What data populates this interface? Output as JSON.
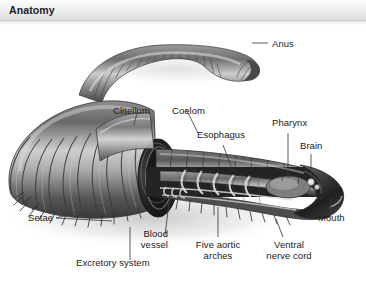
{
  "header": {
    "title": "Anatomy"
  },
  "figure": {
    "alt": "Cutaway illustration of an earthworm showing external segments and internal organs",
    "palette": {
      "body_dark": "#3d3d3d",
      "body_mid": "#6e6e6e",
      "body_light": "#b4b4b4",
      "highlight": "#e2e2e2",
      "organ_dark": "#2b2b2b",
      "background": "#ffffff",
      "label_text": "#1a1a1a",
      "leader_line": "#4d4d4d",
      "header_text": "#1c1c1c"
    }
  },
  "labels": [
    {
      "id": "anus",
      "text": "Anus"
    },
    {
      "id": "clitellum",
      "text": "Clitellum"
    },
    {
      "id": "coelom",
      "text": "Coelom"
    },
    {
      "id": "esophagus",
      "text": "Esophagus"
    },
    {
      "id": "pharynx",
      "text": "Pharynx"
    },
    {
      "id": "brain",
      "text": "Brain"
    },
    {
      "id": "mouth",
      "text": "Mouth"
    },
    {
      "id": "setae",
      "text": "Setae"
    },
    {
      "id": "blood_vessel_1",
      "text": "Blood"
    },
    {
      "id": "blood_vessel_2",
      "text": "vessel"
    },
    {
      "id": "excretory_system",
      "text": "Excretory system"
    },
    {
      "id": "aortic_arches_1",
      "text": "Five aortic"
    },
    {
      "id": "aortic_arches_2",
      "text": "arches"
    },
    {
      "id": "nerve_cord_1",
      "text": "Ventral"
    },
    {
      "id": "nerve_cord_2",
      "text": "nerve cord"
    }
  ]
}
